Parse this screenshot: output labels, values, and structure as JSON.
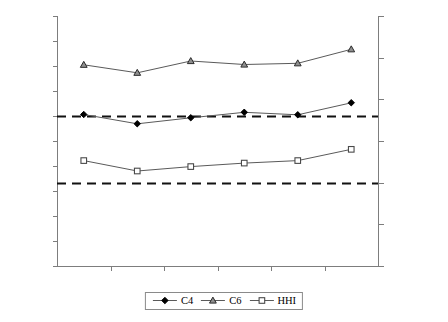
{
  "chart_data": {
    "type": "line",
    "title": "",
    "xlabel": "",
    "ylabel": "",
    "categories": [
      "1984",
      "1988",
      "1992",
      "1996",
      "2001",
      "2005"
    ],
    "axes": {
      "left": {
        "label": "",
        "ylim": [
          0.0,
          100.0
        ],
        "ticks": [
          "0.0",
          "10.0",
          "20.0",
          "30.0",
          "40.0",
          "50.0",
          "60.0",
          "70.0",
          "80.0",
          "90.0",
          "100.0"
        ],
        "tick_values": [
          0,
          10,
          20,
          30,
          40,
          50,
          60,
          70,
          80,
          90,
          100
        ]
      },
      "right": {
        "label": "",
        "ylim": [
          0,
          3000
        ],
        "ticks": [
          "0",
          "500",
          "1000",
          "1500",
          "2000",
          "2500",
          "3000"
        ],
        "tick_values": [
          0,
          500,
          1000,
          1500,
          2000,
          2500,
          3000
        ]
      },
      "grid": false
    },
    "series": [
      {
        "name": "C4",
        "axis": "left",
        "marker": "diamond",
        "color": "#000000",
        "values": [
          60.6,
          56.9,
          59.3,
          61.5,
          60.5,
          65.3
        ]
      },
      {
        "name": "C6",
        "axis": "left",
        "marker": "triangle",
        "color": "#333333",
        "values": [
          80.5,
          77.3,
          82.0,
          80.6,
          81.1,
          86.7
        ]
      },
      {
        "name": "HHI",
        "axis": "right",
        "marker": "square",
        "color": "#555555",
        "values": [
          1265,
          1140,
          1193,
          1235,
          1265,
          1400
        ],
        "values_on_left_scale": [
          42.2,
          38.0,
          39.8,
          41.2,
          42.2,
          46.7
        ]
      }
    ],
    "reference_lines": [
      {
        "name": "upper-threshold",
        "left_value": 60.0,
        "right_value": 1800,
        "style": "dashed"
      },
      {
        "name": "lower-threshold",
        "left_value": 33.3,
        "right_value": 1000,
        "style": "dashed"
      }
    ],
    "legend": {
      "position": "bottom-center",
      "entries": [
        {
          "label": "C4",
          "marker": "diamond"
        },
        {
          "label": "C6",
          "marker": "triangle"
        },
        {
          "label": "HHI",
          "marker": "square"
        }
      ]
    }
  }
}
